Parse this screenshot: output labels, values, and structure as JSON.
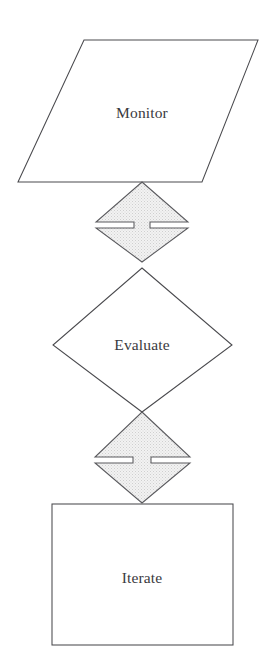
{
  "diagram": {
    "background_color": "#ffffff",
    "outline_color": "#4a4a4e",
    "connector_fill_color": "#e8e8e8",
    "connector_stroke_color": "#5a5a5e",
    "text_color": "#3a3a3e",
    "nodes": [
      {
        "id": "monitor",
        "label": "Monitor",
        "shape": "parallelogram",
        "fill": "#ffffff",
        "center_x": 142,
        "center_y": 113
      },
      {
        "id": "evaluate",
        "label": "Evaluate",
        "shape": "diamond",
        "fill": "#ffffff",
        "center_x": 142,
        "center_y": 345
      },
      {
        "id": "iterate",
        "label": "Iterate",
        "shape": "rectangle",
        "fill": "#ffffff",
        "center_x": 142,
        "center_y": 578
      }
    ],
    "connectors": [
      {
        "id": "monitor-evaluate",
        "shape": "double-headed-arrow",
        "label": "",
        "fill": "#e8e8e8",
        "from": "monitor",
        "to": "evaluate",
        "center_x": 142,
        "center_y": 222
      },
      {
        "id": "evaluate-iterate",
        "shape": "double-headed-arrow",
        "label": "",
        "fill": "#e8e8e8",
        "from": "evaluate",
        "to": "iterate",
        "center_x": 142,
        "center_y": 457
      }
    ]
  }
}
